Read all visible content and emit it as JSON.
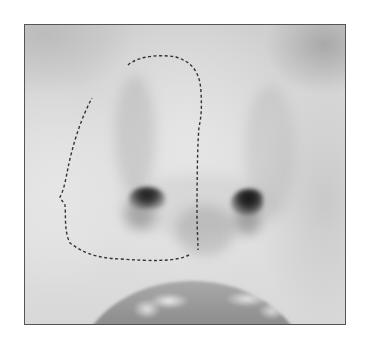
{
  "image": {
    "subject": "grayscale close-up photo of a nose with a dashed selection outline around the left side",
    "frame": {
      "x": 24,
      "y": 24,
      "width": 321,
      "height": 300,
      "border_color": "#555555"
    },
    "colors": {
      "skin_light": "#e0e0e0",
      "skin_mid": "#d0d0d0",
      "nostril_dark": "#1e1e1e",
      "lips": "#8e8e8e",
      "selection_stroke": "#333333"
    },
    "selection": {
      "style": "dashed",
      "path": "M128,65 C138,56 160,54 176,57 C192,62 200,72 201,92 C202,110 201,118 199,127 C197,150 197,200 197,212 C197,230 198,240 198,250 M189,255 C175,262 150,261 120,259 C95,258 82,252 70,243 C64,232 66,215 65,205 C63,201 60,199 60,197 C64,190 66,178 68,168 C72,148 80,120 92,98"
    }
  }
}
